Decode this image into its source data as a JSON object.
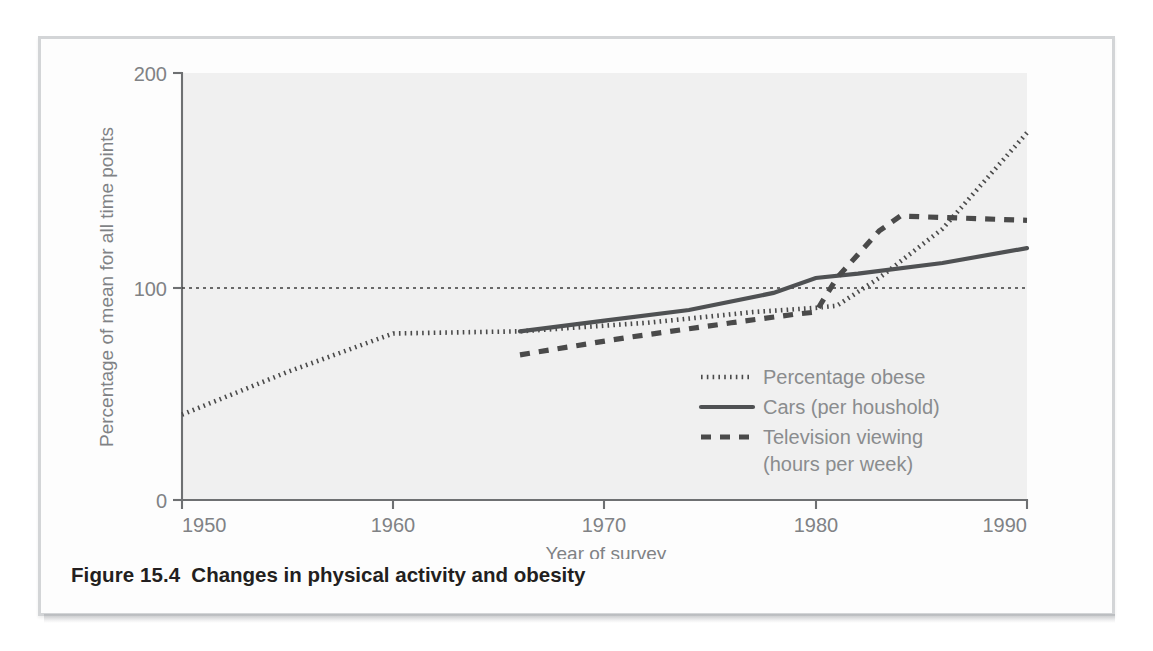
{
  "figure": {
    "caption_number": "Figure 15.4",
    "caption_text": "Changes in physical activity and obesity"
  },
  "chart_data": {
    "type": "line",
    "title": "Changes in physical activity and obesity",
    "xlabel": "Year of survey",
    "ylabel": "Percentage of mean for all time points",
    "xlim": [
      1950,
      1990
    ],
    "ylim": [
      0,
      200
    ],
    "xticks": [
      1950,
      1960,
      1970,
      1980,
      1990
    ],
    "yticks": [
      0,
      100,
      200
    ],
    "grid": false,
    "reference_line": {
      "value": 100,
      "style": "dotted",
      "label": "100"
    },
    "legend_position": "inside-lower-right",
    "series": [
      {
        "name": "Percentage obese",
        "style": "dotted",
        "color": "#4a4a4a",
        "x": [
          1950,
          1955,
          1960,
          1966,
          1972,
          1977,
          1980,
          1981,
          1983,
          1986,
          1990
        ],
        "y": [
          40,
          60,
          78,
          79,
          83,
          88,
          90,
          91,
          104,
          127,
          172
        ]
      },
      {
        "name": "Cars (per houshold)",
        "style": "solid",
        "color": "#4f5153",
        "x": [
          1966,
          1970,
          1974,
          1978,
          1980,
          1982,
          1986,
          1990
        ],
        "y": [
          79,
          84,
          89,
          97,
          104,
          106,
          111,
          118
        ]
      },
      {
        "name": "Television viewing (hours per week)",
        "style": "dashed",
        "color": "#4a4a4a",
        "x": [
          1966,
          1971,
          1976,
          1979,
          1980,
          1981,
          1983,
          1984,
          1987,
          1990
        ],
        "y": [
          68,
          76,
          83,
          87,
          88,
          104,
          126,
          133,
          132,
          131
        ]
      }
    ]
  },
  "legend": {
    "items": [
      {
        "label": "Percentage obese",
        "marker": "dotted"
      },
      {
        "label": "Cars (per houshold)",
        "marker": "solid"
      },
      {
        "label": "Television viewing",
        "marker": "dashed"
      },
      {
        "label": "(hours per week)",
        "marker": "none"
      }
    ]
  },
  "axes": {
    "y_label": "Percentage of mean for all time points",
    "x_label": "Year of survey",
    "y_tick_200": "200",
    "y_tick_100": "100",
    "y_tick_0": "0",
    "x_tick_1950": "1950",
    "x_tick_1960": "1960",
    "x_tick_1970": "1970",
    "x_tick_1980": "1980",
    "x_tick_1990": "1990"
  }
}
